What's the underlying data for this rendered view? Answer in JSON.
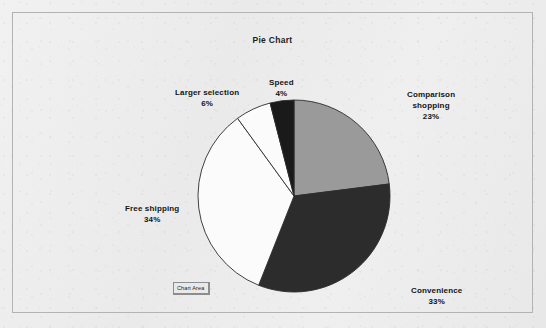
{
  "chart_data": {
    "type": "pie",
    "title": "Pie Chart",
    "xlabel": "",
    "ylabel": "",
    "legend_position": "none",
    "grid": false,
    "labels_on_slices": true,
    "start_angle_deg": 0,
    "direction": "clockwise",
    "categories": [
      "Comparison shopping",
      "Convenience",
      "Free shipping",
      "Larger selection",
      "Speed"
    ],
    "values": [
      23,
      33,
      34,
      6,
      4
    ],
    "value_suffix": "%",
    "slices": [
      {
        "name": "Comparison shopping",
        "value": 23,
        "value_text": "23%",
        "label_line1": "Comparison",
        "label_line2": "shopping",
        "color": "#9a9a9a",
        "start_deg": 0,
        "end_deg": 82.8
      },
      {
        "name": "Convenience",
        "value": 33,
        "value_text": "33%",
        "label_line1": "Convenience",
        "label_line2": "",
        "color": "#2c2c2c",
        "start_deg": 82.8,
        "end_deg": 201.6
      },
      {
        "name": "Free shipping",
        "value": 34,
        "value_text": "34%",
        "label_line1": "Free shipping",
        "label_line2": "",
        "color": "#fbfbfb",
        "start_deg": 201.6,
        "end_deg": 324.0
      },
      {
        "name": "Larger selection",
        "value": 6,
        "value_text": "6%",
        "label_line1": "Larger selection",
        "label_line2": "",
        "color": "#fbfbfb",
        "start_deg": 324.0,
        "end_deg": 345.6
      },
      {
        "name": "Speed",
        "value": 4,
        "value_text": "4%",
        "label_line1": "Speed",
        "label_line2": "",
        "color": "#1a1a1a",
        "start_deg": 345.6,
        "end_deg": 360.0
      }
    ]
  },
  "tooltip": {
    "text": "Chart Area"
  },
  "colors": {
    "background": "#ecebeb",
    "frame_border": "#b3b3b3",
    "slice_outline": "#2b2b2b",
    "text": "#141414"
  }
}
